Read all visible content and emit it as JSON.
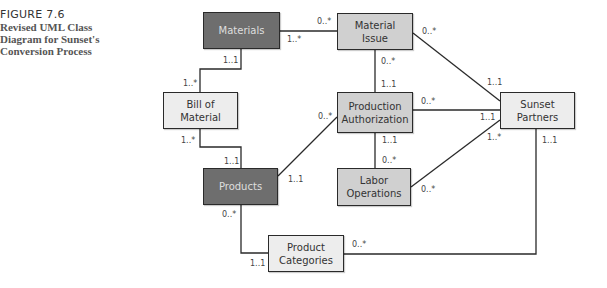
{
  "caption": {
    "figure": "FIGURE 7.6",
    "title_lines": [
      "Revised UML Class",
      "Diagram for Sunset's",
      "Conversion Process"
    ]
  },
  "classes": {
    "materials": {
      "label": "Materials"
    },
    "material_issue": {
      "label1": "Material",
      "label2": "Issue"
    },
    "bill_of_material": {
      "label1": "Bill of",
      "label2": "Material"
    },
    "production_authorization": {
      "label1": "Production",
      "label2": "Authorization"
    },
    "sunset_partners": {
      "label1": "Sunset",
      "label2": "Partners"
    },
    "products": {
      "label": "Products"
    },
    "labor_operations": {
      "label1": "Labor",
      "label2": "Operations"
    },
    "product_categories": {
      "label1": "Product",
      "label2": "Categories"
    }
  },
  "multiplicities": {
    "materials_issue_a": "0..*",
    "materials_issue_b": "1..*",
    "materials_bom_a": "1..1",
    "materials_bom_b": "1..*",
    "issue_sunset_a": "0..*",
    "issue_sunset_b": "1..1",
    "issue_pa_a": "0..*",
    "issue_pa_b": "1..1",
    "bom_products_a": "1..*",
    "bom_products_b": "1..1",
    "pa_sunset_a": "0..*",
    "pa_sunset_b": "1..1",
    "products_pa_a": "0..*",
    "products_pa_b": "1..1",
    "pa_labor_a": "1..1",
    "pa_labor_b": "0..*",
    "labor_sunset_a": "0..*",
    "labor_sunset_b": "1..*",
    "sunset_cat_a": "1..1",
    "products_cat_a": "0..*",
    "products_cat_b": "1..1",
    "cat_sunset_b": "0..*"
  },
  "colors": {
    "dark_class": "#6e6e6e",
    "mid_class": "#d0d0d0",
    "light_class": "#ededed",
    "line": "#2a2a2a"
  }
}
